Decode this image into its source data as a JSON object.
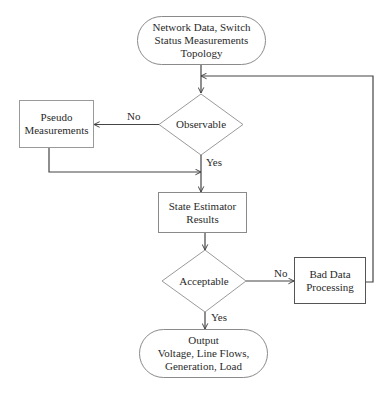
{
  "diagram": {
    "type": "flowchart",
    "colors": {
      "stroke": "#555555",
      "text": "#2a2a2a",
      "background": "#ffffff"
    },
    "nodes": {
      "input": {
        "shape": "terminator",
        "lines": [
          "Network Data, Switch",
          "Status Measurements",
          "Topology"
        ]
      },
      "observable": {
        "shape": "decision",
        "lines": [
          "Observable"
        ]
      },
      "pseudo": {
        "shape": "process",
        "lines": [
          "Pseudo",
          "Measurements"
        ]
      },
      "state_estimator": {
        "shape": "process",
        "lines": [
          "State Estimator",
          "Results"
        ]
      },
      "acceptable": {
        "shape": "decision",
        "lines": [
          "Acceptable"
        ]
      },
      "bad_data": {
        "shape": "process",
        "lines": [
          "Bad Data",
          "Processing"
        ]
      },
      "output": {
        "shape": "terminator",
        "lines": [
          "Output",
          "Voltage, Line Flows,",
          "Generation, Load"
        ]
      }
    },
    "edges": {
      "observable_no": "No",
      "observable_yes": "Yes",
      "acceptable_no": "No",
      "acceptable_yes": "Yes"
    },
    "connections": [
      {
        "from": "input",
        "to": "observable",
        "label": ""
      },
      {
        "from": "observable",
        "to": "pseudo",
        "label": "No"
      },
      {
        "from": "observable",
        "to": "state_estimator",
        "label": "Yes"
      },
      {
        "from": "pseudo",
        "to": "state_estimator",
        "label": ""
      },
      {
        "from": "state_estimator",
        "to": "acceptable",
        "label": ""
      },
      {
        "from": "acceptable",
        "to": "bad_data",
        "label": "No"
      },
      {
        "from": "acceptable",
        "to": "output",
        "label": "Yes"
      },
      {
        "from": "bad_data",
        "to": "observable",
        "label": ""
      }
    ]
  }
}
